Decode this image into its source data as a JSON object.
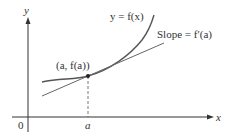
{
  "diagram": {
    "axes": {
      "x_label": "x",
      "y_label": "y",
      "origin_label": "0"
    },
    "curve_label": "y = f(x)",
    "tangent_label": "Slope = f′(a)",
    "point_label": "(a, f(a))",
    "a_label": "a",
    "colors": {
      "axis": "#333333",
      "curve": "#555555",
      "tangent": "#666666",
      "text": "#333333"
    }
  }
}
